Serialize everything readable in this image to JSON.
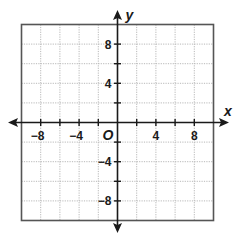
{
  "chart_data": {
    "type": "coordinate-plane",
    "title": "",
    "xlabel": "x",
    "ylabel": "y",
    "origin_label": "O",
    "xlim": [
      -10,
      10
    ],
    "ylim": [
      -10,
      10
    ],
    "grid": true,
    "grid_step": 2,
    "grid_style": "dotted",
    "x_tick_labels": [
      {
        "value": -8,
        "label": "−8"
      },
      {
        "value": -4,
        "label": "−4"
      },
      {
        "value": 4,
        "label": "4"
      },
      {
        "value": 8,
        "label": "8"
      }
    ],
    "y_tick_labels": [
      {
        "value": 8,
        "label": "8"
      },
      {
        "value": 4,
        "label": "4"
      },
      {
        "value": -4,
        "label": "−4"
      },
      {
        "value": -8,
        "label": "−8"
      }
    ],
    "tick_marks": [
      -8,
      -6,
      -4,
      -2,
      2,
      4,
      6,
      8
    ],
    "arrows": {
      "x_both_ends": true,
      "y_both_ends": true
    },
    "series": []
  },
  "colors": {
    "axis": "#1a1a1a",
    "border": "#555555",
    "grid": "#b8b8b8",
    "background": "#ffffff"
  },
  "layout": {
    "origin_px": [
      117.5,
      122.5
    ],
    "unit_px_x": 9.6,
    "unit_px_y": 9.8
  }
}
